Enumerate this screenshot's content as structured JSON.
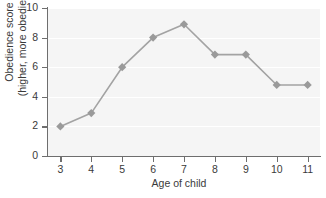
{
  "chart_data": {
    "type": "line",
    "title": "",
    "xlabel": "Age of child",
    "ylabel": "Obedience score (higher, more obedient)",
    "ylabel_lines": [
      "Obedience score",
      "(higher, more obedient)"
    ],
    "x": [
      3,
      4,
      5,
      6,
      7,
      8,
      9,
      10,
      11
    ],
    "values": [
      2.0,
      2.9,
      6.0,
      8.0,
      8.9,
      6.85,
      6.85,
      4.8,
      4.8
    ],
    "xtick_labels": [
      "3",
      "4",
      "5",
      "6",
      "7",
      "8",
      "9",
      "10",
      "11"
    ],
    "ytick_labels": [
      "0",
      "2",
      "4",
      "6",
      "8",
      "10"
    ],
    "yticks": [
      0,
      2,
      4,
      6,
      8,
      10
    ],
    "xlim": [
      2.6,
      11.4
    ],
    "ylim": [
      0,
      10
    ],
    "grid": "horizontal",
    "legend": "none",
    "marker": "diamond",
    "series": [
      {
        "name": "Obedience score",
        "values": [
          2.0,
          2.9,
          6.0,
          8.0,
          8.9,
          6.85,
          6.85,
          4.8,
          4.8
        ]
      }
    ],
    "colors": {
      "line": "#a3a3a3",
      "marker": "#9a9a9a",
      "plot_background": "#f5f5f5",
      "gridline": "#ffffff",
      "axis": "#6e6e6e",
      "text": "#3a3a3a"
    }
  }
}
